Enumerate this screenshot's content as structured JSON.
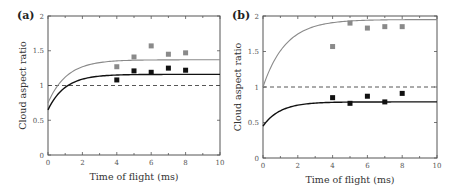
{
  "chart_data": [
    {
      "type": "scatter",
      "panel_label": "(a)",
      "xlabel": "Time of flight (ms)",
      "ylabel": "Cloud aspect ratio",
      "xlim": [
        0,
        10
      ],
      "ylim": [
        0,
        2
      ],
      "xticks": [
        "0",
        "2",
        "4",
        "6",
        "8",
        "10"
      ],
      "yticks": [
        "0",
        "0.5",
        "1",
        "1.5",
        "2"
      ],
      "grid": false,
      "reference_line": {
        "y": 1,
        "style": "dashed"
      },
      "series": [
        {
          "name": "grey data",
          "color": "#8a8a8a",
          "marker": "square",
          "x": [
            4,
            5,
            6,
            7,
            8
          ],
          "y": [
            1.27,
            1.41,
            1.57,
            1.45,
            1.47
          ]
        },
        {
          "name": "black data",
          "color": "#111111",
          "marker": "square",
          "x": [
            4,
            5,
            6,
            7,
            8
          ],
          "y": [
            1.08,
            1.21,
            1.19,
            1.25,
            1.22
          ]
        },
        {
          "name": "grey theory curve",
          "color": "#8a8a8a",
          "line": "solid",
          "start": 0.75,
          "asymptote": 1.37,
          "tau": 1.1
        },
        {
          "name": "black theory curve",
          "color": "#111111",
          "line": "solid",
          "start": 0.65,
          "asymptote": 1.16,
          "tau": 1.0
        }
      ]
    },
    {
      "type": "scatter",
      "panel_label": "(b)",
      "xlabel": "Time of flight (ms)",
      "ylabel": "Cloud aspect ratio",
      "xlim": [
        0,
        10
      ],
      "ylim": [
        0,
        2
      ],
      "xticks": [
        "0",
        "2",
        "4",
        "6",
        "8",
        "10"
      ],
      "yticks": [
        "0",
        "0.5",
        "1",
        "1.5",
        "2"
      ],
      "grid": false,
      "reference_line": {
        "y": 1,
        "style": "dashed"
      },
      "series": [
        {
          "name": "grey data",
          "color": "#8a8a8a",
          "marker": "square",
          "x": [
            4,
            5,
            6,
            7,
            8
          ],
          "y": [
            1.57,
            1.9,
            1.83,
            1.85,
            1.85
          ]
        },
        {
          "name": "black data",
          "color": "#111111",
          "marker": "square",
          "x": [
            4,
            5,
            6,
            7,
            8
          ],
          "y": [
            0.85,
            0.77,
            0.87,
            0.79,
            0.91
          ]
        },
        {
          "name": "grey theory curve",
          "color": "#8a8a8a",
          "line": "solid",
          "start": 1.0,
          "asymptote": 1.95,
          "tau": 1.3
        },
        {
          "name": "black theory curve",
          "color": "#111111",
          "line": "solid",
          "start": 0.45,
          "asymptote": 0.79,
          "tau": 1.0
        }
      ]
    }
  ],
  "layout": {
    "panels": [
      {
        "x0": 48,
        "x1": 220,
        "y_top": 16,
        "y_bottom": 155
      },
      {
        "x0": 263,
        "x1": 437,
        "y_top": 16,
        "y_bottom": 158
      }
    ]
  }
}
